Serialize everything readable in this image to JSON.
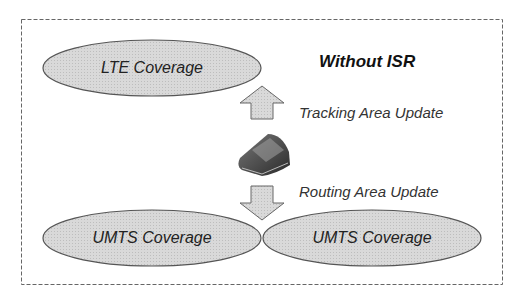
{
  "diagram": {
    "title": "Without ISR",
    "nodes": [
      {
        "id": "lte",
        "label": "LTE Coverage"
      },
      {
        "id": "umts1",
        "label": "UMTS Coverage"
      },
      {
        "id": "umts2",
        "label": "UMTS Coverage"
      }
    ],
    "device": {
      "icon": "mobile-phone-icon"
    },
    "edges": [
      {
        "from": "device",
        "to": "lte",
        "label": "Tracking Area Update",
        "direction": "up"
      },
      {
        "from": "device",
        "to": "umts",
        "label": "Routing Area Update",
        "direction": "down"
      }
    ],
    "colors": {
      "ellipse_fill": "#d6d6d6",
      "ellipse_stroke": "#555555",
      "arrow_fill": "#dcdcdc",
      "border": "#666666"
    }
  }
}
